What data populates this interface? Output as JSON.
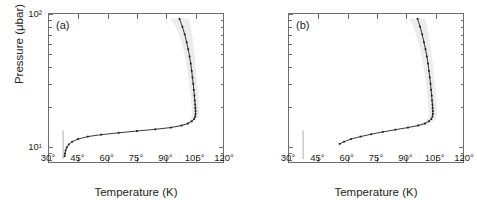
{
  "figure": {
    "xlabel": "Temperature (K)",
    "ylabel": "Pressure (μbar)",
    "xticks": [
      "30°",
      "45°",
      "60°",
      "75°",
      "90°",
      "105°",
      "120°"
    ],
    "xtick_values": [
      30,
      45,
      60,
      75,
      90,
      105,
      120
    ],
    "yticks": [
      "10²",
      "10¹"
    ],
    "ytick_values": [
      100,
      10
    ],
    "panel_a_tag": "(a)",
    "panel_b_tag": "(b)",
    "colors": {
      "curve": "#231f20",
      "band": "#ececec",
      "axis": "#6e6e6e",
      "saturation_line": "#9a9a9a",
      "background": "#ffffff"
    }
  },
  "chart_data": [
    {
      "type": "line",
      "id": "panel-a",
      "title": "(a)",
      "xlabel": "Temperature (K)",
      "ylabel": "Pressure (μbar)",
      "xlim": [
        30,
        120
      ],
      "ylim": [
        100,
        7.5
      ],
      "yscale": "log",
      "y_inverted": true,
      "grid": false,
      "legend": "none",
      "series": [
        {
          "name": "temperature-profile",
          "style": "dotted-with-markers",
          "x": [
            97.5,
            99.0,
            100.2,
            101.2,
            102.0,
            102.7,
            103.3,
            103.8,
            104.2,
            104.6,
            104.9,
            105.2,
            105.4,
            105.6,
            105.7,
            105.8,
            105.8,
            105.6,
            105.0,
            103.8,
            101.8,
            98.5,
            93.0,
            85.0,
            75.5,
            66.0,
            57.0,
            50.0,
            45.0,
            42.0,
            40.2,
            39.2,
            38.6,
            38.3,
            38.1
          ],
          "y": [
            92.0,
            80.0,
            70.0,
            61.0,
            54.0,
            47.5,
            42.0,
            37.0,
            33.0,
            29.5,
            26.5,
            24.0,
            22.0,
            20.5,
            19.3,
            18.3,
            17.4,
            16.6,
            15.9,
            15.3,
            14.7,
            14.2,
            13.7,
            13.3,
            12.9,
            12.5,
            12.1,
            11.7,
            11.2,
            10.7,
            10.2,
            9.7,
            9.2,
            8.7,
            8.3
          ]
        },
        {
          "name": "uncertainty-envelope",
          "style": "shaded-band",
          "x_lower": [
            93.0,
            95.5,
            97.2,
            98.5,
            99.5,
            100.3,
            101.0,
            101.6,
            102.1,
            102.5,
            102.9,
            103.2,
            103.5,
            103.7,
            103.9,
            104.0,
            104.0,
            103.8,
            103.2,
            102.0,
            100.0,
            96.5,
            91.0
          ],
          "x_upper": [
            102.5,
            103.3,
            104.0,
            104.5,
            105.0,
            105.4,
            105.8,
            106.1,
            106.4,
            106.7,
            107.0,
            107.2,
            107.4,
            107.6,
            107.7,
            107.8,
            107.8,
            107.6,
            107.0,
            105.8,
            103.8,
            100.5,
            95.0
          ],
          "y": [
            92.0,
            80.0,
            70.0,
            61.0,
            54.0,
            47.5,
            42.0,
            37.0,
            33.0,
            29.5,
            26.5,
            24.0,
            22.0,
            20.5,
            19.3,
            18.3,
            17.4,
            16.6,
            15.9,
            15.3,
            14.7,
            14.2,
            13.7
          ]
        },
        {
          "name": "saturation-line",
          "style": "thin-solid",
          "x": [
            37.3,
            37.3
          ],
          "y": [
            13.0,
            7.9
          ]
        }
      ]
    },
    {
      "type": "line",
      "id": "panel-b",
      "title": "(b)",
      "xlabel": "Temperature (K)",
      "ylabel": "Pressure (μbar)",
      "xlim": [
        30,
        120
      ],
      "ylim": [
        100,
        7.5
      ],
      "yscale": "log",
      "y_inverted": true,
      "grid": false,
      "legend": "none",
      "series": [
        {
          "name": "temperature-profile",
          "style": "dotted-with-markers",
          "x": [
            96.5,
            97.8,
            98.9,
            99.8,
            100.6,
            101.3,
            101.9,
            102.4,
            102.8,
            103.2,
            103.5,
            103.8,
            104.0,
            104.2,
            104.3,
            104.4,
            104.4,
            104.2,
            103.6,
            102.4,
            100.3,
            96.8,
            91.5,
            85.0,
            78.5,
            72.5,
            67.0,
            62.0,
            58.5,
            56.2
          ],
          "y": [
            92.0,
            80.0,
            70.0,
            61.0,
            54.0,
            47.5,
            42.0,
            37.0,
            33.0,
            29.5,
            26.5,
            24.0,
            22.0,
            20.5,
            19.3,
            18.3,
            17.4,
            16.6,
            15.9,
            15.3,
            14.7,
            14.2,
            13.7,
            13.2,
            12.7,
            12.2,
            11.7,
            11.2,
            10.7,
            10.3
          ]
        },
        {
          "name": "uncertainty-envelope",
          "style": "shaded-band",
          "x_lower": [
            92.5,
            94.2,
            95.6,
            96.8,
            97.8,
            98.6,
            99.3,
            99.9,
            100.4,
            100.8,
            101.2,
            101.5,
            101.8,
            102.0,
            102.2,
            102.3,
            102.3,
            102.1,
            101.5,
            100.3,
            98.2,
            94.8,
            89.5
          ],
          "x_upper": [
            100.5,
            101.4,
            102.2,
            102.8,
            103.4,
            103.9,
            104.4,
            104.8,
            105.1,
            105.4,
            105.7,
            106.0,
            106.2,
            106.4,
            106.5,
            106.6,
            106.6,
            106.4,
            105.8,
            104.6,
            102.5,
            99.0,
            93.8
          ],
          "y": [
            92.0,
            80.0,
            70.0,
            61.0,
            54.0,
            47.5,
            42.0,
            37.0,
            33.0,
            29.5,
            26.5,
            24.0,
            22.0,
            20.5,
            19.3,
            18.3,
            17.4,
            16.6,
            15.9,
            15.3,
            14.7,
            14.2,
            13.7
          ]
        },
        {
          "name": "saturation-line",
          "style": "thin-solid",
          "x": [
            37.3,
            37.3
          ],
          "y": [
            13.0,
            7.9
          ]
        }
      ]
    }
  ]
}
